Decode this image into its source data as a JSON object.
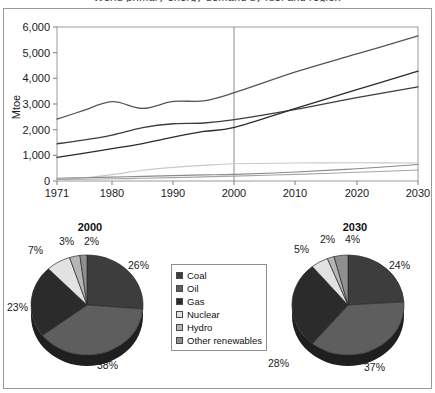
{
  "figure": {
    "title": "World primary energy demand by fuel and region",
    "frame_color": "#9a9a9a"
  },
  "chart_data": [
    {
      "type": "line",
      "title": "World primary energy demand by fuel",
      "xlabel": "",
      "ylabel": "Mtoe",
      "xlim": [
        1971,
        2030
      ],
      "ylim": [
        0,
        6000
      ],
      "xticks": [
        "1971",
        "1980",
        "1990",
        "2000",
        "2010",
        "2020",
        "2030"
      ],
      "yticks": [
        "0",
        "1,000",
        "2,000",
        "3,000",
        "4,000",
        "5,000",
        "6,000"
      ],
      "grid": false,
      "legend": "none",
      "annotations": [
        {
          "label": "projection divider",
          "x": 2000
        }
      ],
      "x": [
        1971,
        1975,
        1980,
        1985,
        1990,
        1995,
        2000,
        2010,
        2020,
        2030
      ],
      "series": [
        {
          "name": "Oil",
          "color": "#555555",
          "values": [
            2410,
            2720,
            3090,
            2830,
            3100,
            3120,
            3440,
            4250,
            4950,
            5650
          ]
        },
        {
          "name": "Coal",
          "color": "#3d3d3d",
          "values": [
            1450,
            1580,
            1790,
            2080,
            2230,
            2260,
            2390,
            2790,
            3250,
            3670
          ]
        },
        {
          "name": "Gas",
          "color": "#2b2b2b",
          "values": [
            920,
            1070,
            1260,
            1460,
            1710,
            1930,
            2090,
            2830,
            3560,
            4280
          ]
        },
        {
          "name": "Nuclear",
          "color": "#c9c9c9",
          "values": [
            30,
            110,
            250,
            420,
            530,
            610,
            670,
            700,
            710,
            700
          ]
        },
        {
          "name": "Hydro",
          "color": "#8a8a8a",
          "values": [
            105,
            125,
            150,
            180,
            210,
            240,
            260,
            350,
            480,
            640
          ]
        },
        {
          "name": "Other renewables",
          "color": "#a6a6a6",
          "values": [
            60,
            70,
            85,
            105,
            130,
            160,
            190,
            260,
            340,
            430
          ]
        }
      ]
    },
    {
      "type": "pie",
      "title": "2000",
      "labels": [
        "Coal",
        "Oil",
        "Gas",
        "Nuclear",
        "Hydro",
        "Other renewables"
      ],
      "values": [
        26,
        38,
        23,
        7,
        3,
        2
      ],
      "value_labels": [
        "26%",
        "38%",
        "23%",
        "7%",
        "3%",
        "2%"
      ],
      "colors": [
        "#3d3d3d",
        "#5e5e5e",
        "#2b2b2b",
        "#e2e2e2",
        "#b5b5b5",
        "#8f8f8f"
      ]
    },
    {
      "type": "pie",
      "title": "2030",
      "labels": [
        "Coal",
        "Oil",
        "Gas",
        "Nuclear",
        "Hydro",
        "Other renewables"
      ],
      "values": [
        24,
        37,
        28,
        5,
        2,
        4
      ],
      "value_labels": [
        "24%",
        "37%",
        "28%",
        "5%",
        "2%",
        "4%"
      ],
      "colors": [
        "#3d3d3d",
        "#5e5e5e",
        "#2b2b2b",
        "#e2e2e2",
        "#b5b5b5",
        "#8f8f8f"
      ]
    }
  ],
  "axis": {
    "ylabel": "Mtoe",
    "yticks": [
      "6,000",
      "5,000",
      "4,000",
      "3,000",
      "2,000",
      "1,000",
      "0"
    ],
    "xticks": [
      "1971",
      "1980",
      "1990",
      "2000",
      "2010",
      "2020",
      "2030"
    ]
  },
  "legend": {
    "items": [
      {
        "label": "Coal",
        "color": "#3d3d3d"
      },
      {
        "label": "Oil",
        "color": "#5e5e5e"
      },
      {
        "label": "Gas",
        "color": "#2b2b2b"
      },
      {
        "label": "Nuclear",
        "color": "#e2e2e2"
      },
      {
        "label": "Hydro",
        "color": "#b5b5b5"
      },
      {
        "label": "Other renewables",
        "color": "#8f8f8f"
      }
    ]
  },
  "pies": {
    "y2000": {
      "title": "2000",
      "labels": {
        "coal": "26%",
        "oil": "38%",
        "gas": "23%",
        "nuclear": "7%",
        "hydro": "3%",
        "other": "2%"
      }
    },
    "y2030": {
      "title": "2030",
      "labels": {
        "coal": "24%",
        "oil": "37%",
        "gas": "28%",
        "nuclear": "5%",
        "hydro": "2%",
        "other": "4%"
      }
    }
  }
}
